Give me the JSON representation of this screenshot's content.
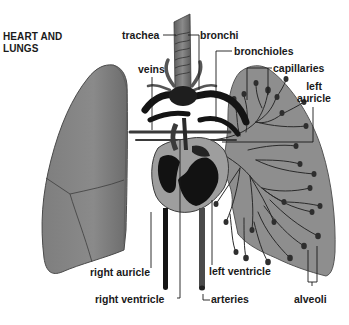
{
  "title": {
    "line1": "HEART AND",
    "line2": "LUNGS"
  },
  "labels": {
    "trachea": "trachea",
    "bronchi": "bronchi",
    "bronchioles": "bronchioles",
    "veins": "veins",
    "capillaries": "capillaries",
    "left_auricle_line1": "left",
    "left_auricle_line2": "auricle",
    "right_auricle": "right auricle",
    "left_ventricle": "left ventricle",
    "right_ventricle": "right ventricle",
    "arteries": "arteries",
    "alveoli": "alveoli"
  },
  "colors": {
    "background": "#ffffff",
    "lung_fill": "#8c8c8c",
    "lung_fill_dark": "#6f6f6f",
    "heart_fill": "#9a9a9a",
    "vessel_dark": "#141414",
    "text": "#1a1a1a"
  }
}
